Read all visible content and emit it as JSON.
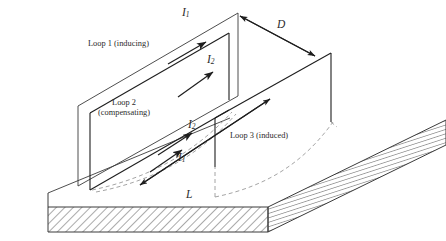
{
  "figure": {
    "type": "3d-perspective-line-diagram",
    "background": "#ffffff",
    "line_color": "#3a3a3a",
    "heavy_line_color": "#1e1e1e",
    "dashed_color": "#8c8c8c",
    "hatch_color": "#555555",
    "text_color": "#2b2b2b",
    "width": 446,
    "height": 241
  },
  "labels": {
    "loop1": {
      "line1": "Loop 1 (inducing)",
      "x": 88,
      "y": 39
    },
    "loop2": {
      "line1": "Loop 2",
      "line2": "(compensating)",
      "x": 98,
      "y": 98
    },
    "loop3": {
      "line1": "Loop 3 (induced)",
      "x": 230,
      "y": 131
    },
    "current_i1_top": {
      "text": "I",
      "sub": "1",
      "x": 182,
      "y": 6
    },
    "current_i2_top": {
      "text": "I",
      "sub": "2",
      "x": 207,
      "y": 53
    },
    "current_i2_mid": {
      "text": "I",
      "sub": "2",
      "x": 188,
      "y": 118
    },
    "current_i1_mid": {
      "text": "I",
      "sub": "1",
      "x": 178,
      "y": 151
    },
    "distance_d": {
      "text": "D",
      "x": 277,
      "y": 18
    },
    "length_l": {
      "text": "L",
      "x": 186,
      "y": 188
    }
  },
  "annotations": {
    "arrows": [
      {
        "name": "i1-top-arrow",
        "desc": "current direction on Loop 1 top edge, pointing up-right"
      },
      {
        "name": "i2-top-arrow",
        "desc": "current direction on Loop 2 top edge, pointing up-right"
      },
      {
        "name": "i2-mid-arrow",
        "desc": "current direction on Loop 2 lower edge, pointing up-right"
      },
      {
        "name": "i1-mid-arrow",
        "desc": "current direction on Loop 1 lower edge, pointing up-right"
      },
      {
        "name": "d-dimension-arrow",
        "desc": "double-headed arrow measuring separation D between Loop 1 and Loop 3"
      },
      {
        "name": "l-dimension-arrow",
        "desc": "double-headed arrow measuring loop length L along the ground plane"
      }
    ],
    "dashed_curves": "hidden/projected loop edges below the ground plane surface, drawn dashed",
    "hatching": "45-degree hatch fill on the front face and right receding face of the ground slab"
  }
}
